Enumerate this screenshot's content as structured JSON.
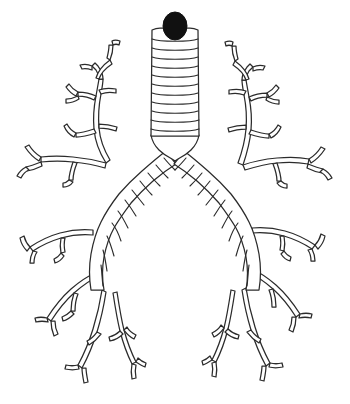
{
  "figure": {
    "title": "Bronchial Tree",
    "style": "black-and-white line drawing",
    "background_color": "#ffffff",
    "line_color": "#2b2b2b",
    "fill_color": "#111111",
    "canvas": {
      "width": 350,
      "height": 404
    }
  },
  "parts": [
    {
      "id": "glottis",
      "label": "Glottic opening",
      "description": "Solid black oval at the superior end of the trachea",
      "color": "#111111"
    },
    {
      "id": "trachea",
      "label": "Trachea",
      "description": "Vertical tube with stacked cartilage rings",
      "ring_count": 11
    },
    {
      "id": "carina",
      "label": "Carina",
      "description": "Ridge where the trachea divides into the two main bronchi"
    },
    {
      "id": "left-main-bronchus",
      "label": "Left main bronchus",
      "description": "Ringed airway descending to the left lung",
      "ring_count": 9
    },
    {
      "id": "right-main-bronchus",
      "label": "Right main bronchus",
      "description": "Ringed airway descending to the right lung",
      "ring_count": 10
    },
    {
      "id": "left-upper-lobe-branches",
      "label": "Left upper lobe bronchi",
      "description": "Upward and lateral branching tree in the left upper field"
    },
    {
      "id": "left-lower-lobe-branches",
      "label": "Left lower lobe bronchi",
      "description": "Lateral and downward branching tree in the left lower field"
    },
    {
      "id": "right-upper-lobe-branches",
      "label": "Right upper lobe bronchi",
      "description": "Upward and lateral branching tree in the right upper field"
    },
    {
      "id": "right-lower-lobe-branches",
      "label": "Right lower lobe bronchi",
      "description": "Lateral and downward branching tree in the right lower field"
    },
    {
      "id": "terminal-bronchioles",
      "label": "Terminal bronchioles",
      "description": "Fine forked airway tips at the periphery of both lungs"
    }
  ]
}
